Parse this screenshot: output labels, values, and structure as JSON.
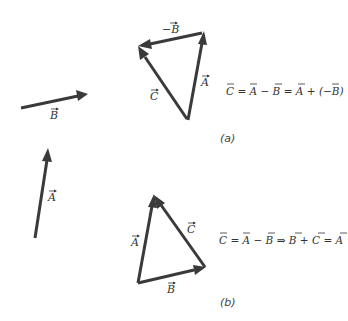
{
  "figure": {
    "vector_color": "#3a3a3a",
    "standalone": {
      "vector_b_label": "B",
      "vector_a_label": "A"
    },
    "part_a": {
      "caption": "(a)",
      "neg_b_label": "−B",
      "a_label": "A",
      "c_label": "C",
      "equation": {
        "t1": "C",
        "t2": " = ",
        "t3": "A",
        "t4": " − ",
        "t5": "B",
        "t6": " = ",
        "t7": "A",
        "t8": " + (−",
        "t9": "B",
        "t10": ")"
      }
    },
    "part_b": {
      "caption": "(b)",
      "a_label": "A",
      "b_label": "B",
      "c_label": "C",
      "equation": {
        "t1": "C",
        "t2": " = ",
        "t3": "A",
        "t4": " − ",
        "t5": "B",
        "t6": " ⇒ ",
        "t7": "B",
        "t8": " + ",
        "t9": "C",
        "t10": " = ",
        "t11": "A"
      }
    }
  }
}
